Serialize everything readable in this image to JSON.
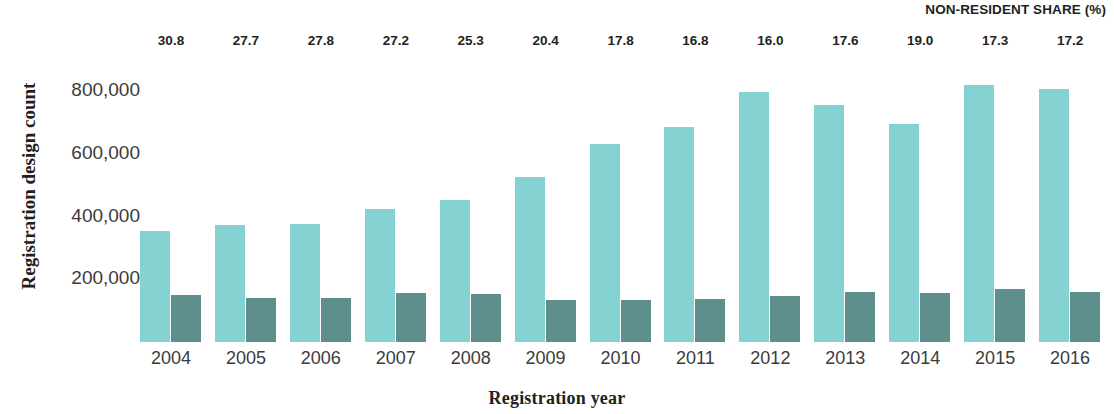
{
  "chart_data": {
    "type": "bar",
    "title": "",
    "xlabel": "Registration year",
    "ylabel": "Registration design count",
    "annotation_title": "NON-RESIDENT SHARE (%)",
    "categories": [
      "2004",
      "2005",
      "2006",
      "2007",
      "2008",
      "2009",
      "2010",
      "2011",
      "2012",
      "2013",
      "2014",
      "2015",
      "2016"
    ],
    "series": [
      {
        "name": "Resident",
        "color": "#84d3d2",
        "values": [
          353000,
          375000,
          378000,
          425000,
          452000,
          528000,
          632000,
          687000,
          797000,
          757000,
          697000,
          820000,
          807000
        ]
      },
      {
        "name": "Non-resident",
        "color": "#5f8f8d",
        "values": [
          150000,
          142000,
          142000,
          157000,
          152000,
          135000,
          133000,
          137000,
          148000,
          160000,
          157000,
          168000,
          160000
        ]
      }
    ],
    "annotations": {
      "label": "NON-RESIDENT SHARE (%)",
      "values": [
        "30.8",
        "27.7",
        "27.8",
        "27.2",
        "25.3",
        "20.4",
        "17.8",
        "16.8",
        "16.0",
        "17.6",
        "19.0",
        "17.3",
        "17.2"
      ]
    },
    "ylim": [
      0,
      900000
    ],
    "yticks": [
      200000,
      400000,
      600000,
      800000
    ],
    "ytick_labels": [
      "200,000",
      "400,000",
      "600,000",
      "800,000"
    ],
    "grid": false,
    "legend": "none"
  }
}
